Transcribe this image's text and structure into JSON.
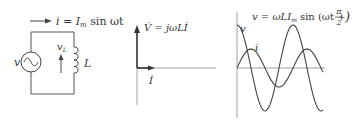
{
  "circuit": {
    "current_label": "i = I",
    "current_sub": "m",
    "current_tail": " sin ωt",
    "source_label": "v",
    "inductor_label": "L",
    "vl_label": "v",
    "vl_sub": "L"
  },
  "phasor": {
    "v_label": "V̇ = jωLİ",
    "i_label": "İ"
  },
  "waveform": {
    "equation": "v = ωLI",
    "equation_sub": "m",
    "equation_tail": " sin (ωt +",
    "frac_num": "π",
    "frac_den": "2",
    "close": ")",
    "v_label": "v",
    "i_label": "i"
  },
  "colors": {
    "stroke": "#444444",
    "text": "#333333",
    "axis": "#777777"
  }
}
